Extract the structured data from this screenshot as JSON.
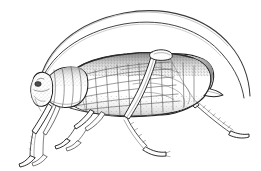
{
  "image": {
    "title": "Cricket / katydid lateral line drawing",
    "subject": "cricket",
    "style": "pen-and-ink stipple line engraving",
    "orientation": "left-facing lateral view",
    "width": 261,
    "height": 171,
    "background_color": "#ffffff",
    "ink_color": "#222222",
    "shading_color": "#4a4a4a",
    "caption": ""
  },
  "anatomy": {
    "parts": [
      {
        "id": "antenna-upper",
        "label": "Upper antenna",
        "count": 1,
        "description": "Very long filiform antenna arcing high over the body and tapering toward the lower right"
      },
      {
        "id": "antenna-lower",
        "label": "Lower antenna",
        "count": 1,
        "description": "Second filiform antenna running parallel just below the first"
      },
      {
        "id": "head",
        "label": "Head",
        "count": 1,
        "description": "Small rounded head at far left with compound eye and mouthparts"
      },
      {
        "id": "eye",
        "label": "Compound eye",
        "count": 1,
        "description": "Small dark oval eye on the head"
      },
      {
        "id": "pronotum",
        "label": "Pronotum",
        "count": 1,
        "description": "Saddle-shaped plate behind the head with vertical ridge lines"
      },
      {
        "id": "tegmen",
        "label": "Tegmen (forewing)",
        "count": 1,
        "description": "Large folded forewing covering the abdomen with rectangular reticulate venation and stippled dorsal shading"
      },
      {
        "id": "abdomen",
        "label": "Abdomen",
        "count": 1,
        "description": "Body tapering to a pointed tip at the right rear"
      },
      {
        "id": "foreleg",
        "label": "Foreleg",
        "count": 2,
        "description": "Slender front legs angling down and to the left with segmented tarsi"
      },
      {
        "id": "midleg",
        "label": "Middle leg",
        "count": 2,
        "description": "Mid legs descending below the thorax"
      },
      {
        "id": "hindleg-femur",
        "label": "Hind femur",
        "count": 2,
        "description": "Two long saltatorial femora meeting at an apex above the wing"
      },
      {
        "id": "hindleg-tibia",
        "label": "Hind tibia",
        "count": 2,
        "description": "Long spined tibiae extending down and to the lower right"
      },
      {
        "id": "tarsus",
        "label": "Tarsus",
        "count": 6,
        "description": "Small segmented foot at the end of each leg"
      }
    ]
  }
}
